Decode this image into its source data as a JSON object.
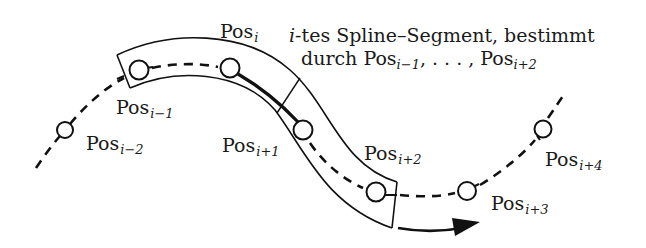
{
  "diagram": {
    "caption": {
      "line1_italic": "i",
      "line1_rest": "-tes Spline–Segment, bestimmt",
      "line2_prefix": "durch Pos",
      "line2_sub1": "i−1",
      "line2_mid": ", . . . , Pos",
      "line2_sub2": "i+2"
    },
    "points": [
      {
        "id": "pos-i-minus-2",
        "base": "Pos",
        "sub": "i−2"
      },
      {
        "id": "pos-i-minus-1",
        "base": "Pos",
        "sub": "i−1"
      },
      {
        "id": "pos-i",
        "base": "Pos",
        "sub": "i"
      },
      {
        "id": "pos-i-plus-1",
        "base": "Pos",
        "sub": "i+1"
      },
      {
        "id": "pos-i-plus-2",
        "base": "Pos",
        "sub": "i+2"
      },
      {
        "id": "pos-i-plus-3",
        "base": "Pos",
        "sub": "i+3"
      },
      {
        "id": "pos-i-plus-4",
        "base": "Pos",
        "sub": "i+4"
      }
    ],
    "colors": {
      "stroke": "#111111",
      "background": "#ffffff"
    },
    "direction": "arrow-right"
  }
}
